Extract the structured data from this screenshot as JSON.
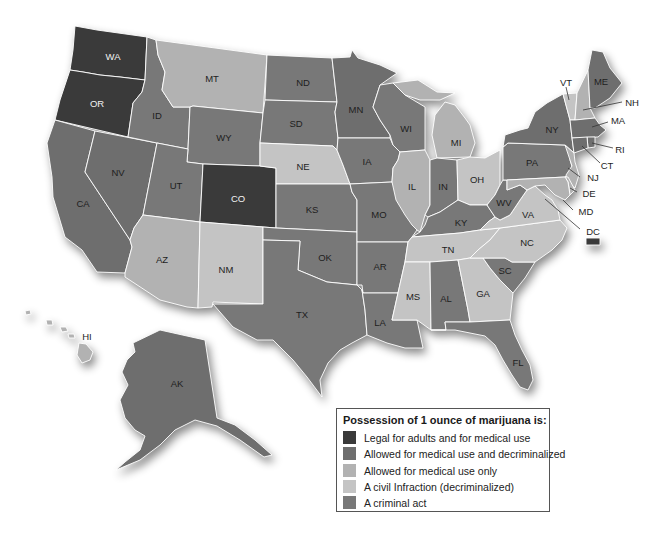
{
  "legend": {
    "title": "Possession of 1 ounce of marijuana is:",
    "items": [
      {
        "key": "legal",
        "label": "Legal for adults and for medical use",
        "color": "#3a3a3a"
      },
      {
        "key": "medical_decrim",
        "label": "Allowed for medical use and decriminalized",
        "color": "#6e6e6e"
      },
      {
        "key": "medical_only",
        "label": "Allowed for medical use only",
        "color": "#b2b2b2"
      },
      {
        "key": "civil",
        "label": "A civil Infraction (decriminalized)",
        "color": "#c4c4c4"
      },
      {
        "key": "criminal",
        "label": "A criminal act",
        "color": "#787878"
      }
    ]
  },
  "states": [
    {
      "abbr": "WA",
      "category": "legal"
    },
    {
      "abbr": "OR",
      "category": "legal"
    },
    {
      "abbr": "CA",
      "category": "medical_decrim"
    },
    {
      "abbr": "NV",
      "category": "medical_decrim"
    },
    {
      "abbr": "ID",
      "category": "criminal"
    },
    {
      "abbr": "MT",
      "category": "medical_only"
    },
    {
      "abbr": "WY",
      "category": "criminal"
    },
    {
      "abbr": "UT",
      "category": "criminal"
    },
    {
      "abbr": "CO",
      "category": "legal"
    },
    {
      "abbr": "AZ",
      "category": "medical_only"
    },
    {
      "abbr": "NM",
      "category": "civil"
    },
    {
      "abbr": "ND",
      "category": "criminal"
    },
    {
      "abbr": "SD",
      "category": "criminal"
    },
    {
      "abbr": "NE",
      "category": "civil"
    },
    {
      "abbr": "KS",
      "category": "criminal"
    },
    {
      "abbr": "OK",
      "category": "criminal"
    },
    {
      "abbr": "TX",
      "category": "criminal"
    },
    {
      "abbr": "MN",
      "category": "medical_decrim"
    },
    {
      "abbr": "IA",
      "category": "criminal"
    },
    {
      "abbr": "MO",
      "category": "criminal"
    },
    {
      "abbr": "AR",
      "category": "criminal"
    },
    {
      "abbr": "LA",
      "category": "criminal"
    },
    {
      "abbr": "WI",
      "category": "criminal"
    },
    {
      "abbr": "IL",
      "category": "medical_only"
    },
    {
      "abbr": "MI",
      "category": "medical_only"
    },
    {
      "abbr": "IN",
      "category": "criminal"
    },
    {
      "abbr": "OH",
      "category": "civil"
    },
    {
      "abbr": "KY",
      "category": "criminal"
    },
    {
      "abbr": "TN",
      "category": "civil"
    },
    {
      "abbr": "MS",
      "category": "civil"
    },
    {
      "abbr": "AL",
      "category": "criminal"
    },
    {
      "abbr": "GA",
      "category": "civil"
    },
    {
      "abbr": "FL",
      "category": "criminal"
    },
    {
      "abbr": "SC",
      "category": "criminal"
    },
    {
      "abbr": "NC",
      "category": "civil"
    },
    {
      "abbr": "VA",
      "category": "civil"
    },
    {
      "abbr": "WV",
      "category": "criminal"
    },
    {
      "abbr": "PA",
      "category": "criminal"
    },
    {
      "abbr": "NY",
      "category": "medical_decrim"
    },
    {
      "abbr": "VT",
      "category": "civil"
    },
    {
      "abbr": "NH",
      "category": "medical_only"
    },
    {
      "abbr": "ME",
      "category": "medical_decrim"
    },
    {
      "abbr": "MA",
      "category": "medical_decrim"
    },
    {
      "abbr": "RI",
      "category": "medical_decrim"
    },
    {
      "abbr": "CT",
      "category": "medical_decrim"
    },
    {
      "abbr": "NJ",
      "category": "medical_only"
    },
    {
      "abbr": "DE",
      "category": "medical_only"
    },
    {
      "abbr": "MD",
      "category": "medical_only"
    },
    {
      "abbr": "DC",
      "category": "legal"
    },
    {
      "abbr": "HI",
      "category": "medical_only"
    },
    {
      "abbr": "AK",
      "category": "medical_decrim"
    }
  ]
}
